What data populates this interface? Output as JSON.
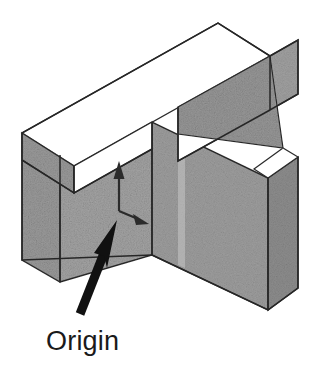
{
  "figure": {
    "type": "technical-illustration",
    "background_color": "#ffffff",
    "label": {
      "text": "Origin",
      "color": "#1a1a1a",
      "x": 46,
      "y": 328,
      "font_size": 27
    },
    "colors": {
      "top_face": "#ffffff",
      "side_face_light": "#a8a8a8",
      "side_face_mid": "#9c9c9c",
      "side_face_dark": "#8f8f8f",
      "outline": "#262626",
      "arrow_pointer": "#111111",
      "axis_arrow": "#2b2b2b",
      "highlight_band": "#e8e8e8"
    },
    "geometry": {
      "description": "Horizontal rectangular bar lying across the top of an upright rectangular slab, drawn in isometric projection",
      "bar_top_apex": [
        218,
        23
      ],
      "bar_right_corner": [
        270,
        56
      ],
      "bar_left_corner": [
        22,
        133
      ],
      "slab_front_bottom_vertex": [
        152,
        255
      ],
      "slab_right_bottom_vertex": [
        268,
        310
      ],
      "slab_left_bottom_vertex": [
        22,
        260
      ]
    },
    "axes": {
      "origin_point": [
        119,
        211
      ],
      "vertical_arrow": {
        "name": "up-axis",
        "from": [
          119,
          211
        ],
        "to": [
          119,
          163
        ]
      },
      "diagonal_arrow": {
        "name": "depth-axis",
        "from": [
          119,
          211
        ],
        "to": [
          147,
          223
        ]
      }
    },
    "pointer": {
      "name": "origin-pointer-arrow",
      "tail": [
        80,
        314
      ],
      "tip": [
        117,
        221
      ],
      "width": 9
    }
  }
}
